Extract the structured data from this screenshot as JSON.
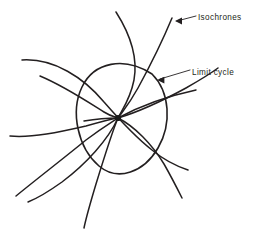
{
  "figure": {
    "background_color": "#ffffff",
    "ink_color": "#231f20",
    "width": 259,
    "height": 242
  },
  "annotations": [
    {
      "id": "isochrones",
      "label": "Isochrones",
      "text_x": 198,
      "text_y": 18,
      "leader_path": "M 196 16 L 177 21",
      "arrow_tip_x": 175,
      "arrow_tip_y": 21,
      "arrow_points": "175,21 182,17.6 182,24.4",
      "target": "isochrone-curve"
    },
    {
      "id": "limit-cycle",
      "label": "Limit cycle",
      "text_x": 192,
      "text_y": 73,
      "leader_path": "M 190 70 L 160 79",
      "arrow_tip_x": 157,
      "arrow_tip_y": 80,
      "arrow_points": "157,80 164.4,76.8 164.4,83.6",
      "target": "limit-cycle-ellipse"
    }
  ],
  "fixed_point": {
    "label": "fixed-point",
    "cx": 118,
    "cy": 118,
    "r": 3.1
  },
  "limit_cycle": {
    "label": "limit cycle",
    "type": "closed-orbit-ellipse",
    "center_x": 118,
    "center_y": 116,
    "radius_x": 40,
    "radius_y": 62,
    "rotation_deg": 28,
    "path": "M 152 74 C 170 92 172 124 158 148 C 144 172 118 182 99 166 C 78 148 70 112 82 87 C 94 62 124 56 152 74 Z"
  },
  "isochrone_curves": [
    {
      "id": "isochrone-1",
      "note": "sweeping arc entering from upper-left, passes through centre toward lower-right",
      "path": "M 22 60 C 54 58 84 78 104 102 C 118 118 134 136 152 150 C 164 160 176 166 188 170"
    },
    {
      "id": "isochrone-2",
      "note": "curve from top, bends down through centre and exits lower-left",
      "path": "M 116 12 C 130 34 138 58 134 80 C 130 100 122 110 118 118 C 108 140 86 164 62 182 C 48 192 38 198 28 202"
    },
    {
      "id": "isochrone-3",
      "note": "near-vertical curve from top right, through cycle, exits bottom",
      "path": "M 172 18 C 162 42 150 66 138 88 C 128 106 122 112 118 118 C 112 132 104 158 96 184 C 90 204 86 218 84 228"
    },
    {
      "id": "isochrone-4",
      "note": "curve entering from left, through centre, exits upper-right",
      "path": "M 10 136 C 32 138 60 132 86 126 C 100 122 112 119 118 118 C 138 112 164 100 186 88 C 200 80 210 74 218 68"
    },
    {
      "id": "isochrone-5",
      "note": "arc entering lower-left, rising through centre region to upper-right exit",
      "path": "M 16 196 C 38 178 64 158 86 140 C 102 128 112 122 118 118 C 140 106 168 96 196 90"
    },
    {
      "id": "isochrone-6",
      "note": "curve from upper-left crossing cycle, bending down to bottom-right",
      "path": "M 40 76 C 64 86 88 102 104 112 C 112 117 116 117 118 118 C 134 126 152 144 164 164 C 172 178 178 190 182 198"
    },
    {
      "id": "isochrone-7",
      "note": "short spoke from centre toward left",
      "path": "M 118 118 C 108 118 96 119 84 121"
    }
  ]
}
